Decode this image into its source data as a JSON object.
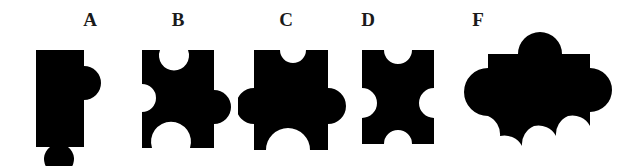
{
  "figure": {
    "background_color": "#ffffff",
    "shape_color": "#000000",
    "label_color": "#1a1a1a"
  },
  "pieces": [
    {
      "label": "A",
      "name": "puzzle-piece-a",
      "edges": {
        "top": "flat",
        "right": "tab",
        "bottom": "tab",
        "left": "flat"
      },
      "label_x": 78,
      "label_y": 10,
      "svg_x": 30,
      "svg_y": 44,
      "svg_w": 80,
      "svg_h": 122
    },
    {
      "label": "B",
      "name": "puzzle-piece-b",
      "edges": {
        "top": "blank",
        "right": "tab",
        "bottom": "blank",
        "left": "blank"
      },
      "label_x": 166,
      "label_y": 10,
      "svg_x": 128,
      "svg_y": 44,
      "svg_w": 110,
      "svg_h": 122
    },
    {
      "label": "C",
      "name": "puzzle-piece-c",
      "edges": {
        "top": "blank",
        "right": "tab",
        "bottom": "blank",
        "left": "tab"
      },
      "label_x": 274,
      "label_y": 10,
      "svg_x": 238,
      "svg_y": 44,
      "svg_w": 118,
      "svg_h": 122
    },
    {
      "label": "D",
      "name": "puzzle-piece-d",
      "edges": {
        "top": "blank",
        "right": "blank",
        "bottom": "blank",
        "left": "blank"
      },
      "label_x": 356,
      "label_y": 10,
      "svg_x": 352,
      "svg_y": 44,
      "svg_w": 108,
      "svg_h": 122
    },
    {
      "label": "F",
      "name": "puzzle-piece-f",
      "edges": {
        "top": "tab",
        "right": "tab",
        "bottom": "tab",
        "left": "tab"
      },
      "label_x": 466,
      "label_y": 10,
      "svg_x": 464,
      "svg_y": 24,
      "svg_w": 168,
      "svg_h": 142
    }
  ]
}
